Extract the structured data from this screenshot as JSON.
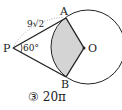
{
  "diagram": {
    "points": {
      "P": "P",
      "A": "A",
      "B": "B",
      "O": "O"
    },
    "length_label": "9√2",
    "angle_label": "60°",
    "answer": "③ 20π",
    "colors": {
      "stroke": "#222222",
      "shade": "#d4d4d4",
      "dotted": "#999999"
    }
  }
}
